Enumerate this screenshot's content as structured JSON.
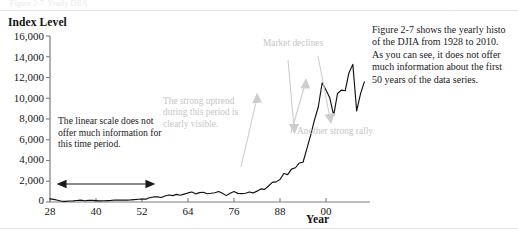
{
  "page": {
    "faint_top_text": "Figure 2-7. Yearly DJIA",
    "axis_value_title": "Index Level",
    "x_axis_title": "Year"
  },
  "annotations": {
    "linear_scale_note": "The linear scale does not offer much information for this time period.",
    "uptrend_note": "The strong uptrend during this period is clearly visible.",
    "declines_note": "Market declines",
    "rally_note": "Another strong rally"
  },
  "caption": {
    "lines": [
      "Figure 2-7 shows the yearly histo",
      "of the DJIA from 1928 to 2010.",
      "As you can see, it does not offer",
      "much information about the first",
      "50 years of the data series."
    ]
  },
  "colors": {
    "line": "#111111",
    "axis": "#7d7d7d",
    "annotation_gray": "#c6c6c6",
    "text": "#1a1a1a"
  },
  "chart_data": {
    "type": "line",
    "title": "",
    "xlabel": "Year",
    "ylabel": "Index Level",
    "ylim": [
      0,
      16000
    ],
    "xlim": [
      1928,
      2010
    ],
    "ytick_labels": [
      "0",
      "2,000",
      "4,000",
      "6,000",
      "8,000",
      "10,000",
      "12,000",
      "14,000",
      "16,000"
    ],
    "ytick_values": [
      0,
      2000,
      4000,
      6000,
      8000,
      10000,
      12000,
      14000,
      16000
    ],
    "xtick_labels": [
      "28",
      "40",
      "52",
      "64",
      "76",
      "88",
      "00"
    ],
    "xtick_values": [
      1928,
      1940,
      1952,
      1964,
      1976,
      1988,
      2000
    ],
    "grid": false,
    "legend": null,
    "series": [
      {
        "name": "DJIA yearly close",
        "x": [
          1928,
          1929,
          1930,
          1931,
          1932,
          1933,
          1934,
          1935,
          1936,
          1937,
          1938,
          1939,
          1940,
          1941,
          1942,
          1943,
          1944,
          1945,
          1946,
          1947,
          1948,
          1949,
          1950,
          1951,
          1952,
          1953,
          1954,
          1955,
          1956,
          1957,
          1958,
          1959,
          1960,
          1961,
          1962,
          1963,
          1964,
          1965,
          1966,
          1967,
          1968,
          1969,
          1970,
          1971,
          1972,
          1973,
          1974,
          1975,
          1976,
          1977,
          1978,
          1979,
          1980,
          1981,
          1982,
          1983,
          1984,
          1985,
          1986,
          1987,
          1988,
          1989,
          1990,
          1991,
          1992,
          1993,
          1994,
          1995,
          1996,
          1997,
          1998,
          1999,
          2000,
          2001,
          2002,
          2003,
          2004,
          2005,
          2006,
          2007,
          2008,
          2009,
          2010
        ],
        "y": [
          300,
          248,
          164,
          77,
          60,
          99,
          104,
          144,
          180,
          121,
          155,
          150,
          131,
          111,
          119,
          136,
          152,
          193,
          177,
          181,
          177,
          200,
          235,
          269,
          292,
          281,
          404,
          488,
          499,
          436,
          584,
          679,
          616,
          731,
          652,
          763,
          874,
          969,
          786,
          905,
          944,
          800,
          839,
          890,
          1020,
          851,
          616,
          852,
          1005,
          831,
          805,
          839,
          964,
          875,
          1047,
          1259,
          1212,
          1547,
          1896,
          1939,
          2169,
          2753,
          2634,
          3169,
          3301,
          3754,
          3834,
          5117,
          6448,
          7908,
          9181,
          11497,
          10787,
          10022,
          8342,
          10454,
          10783,
          10718,
          12463,
          13265,
          8776,
          10428,
          11578
        ]
      }
    ],
    "marked_regions": [
      {
        "label": "flat linear-scale period",
        "x_start": 1930,
        "x_end": 1954,
        "style": "double-headed-arrow"
      },
      {
        "label": "The strong uptrend during this period is clearly visible.",
        "x_start": 1980,
        "x_end": 1998,
        "direction": "up"
      },
      {
        "label": "Market declines",
        "x_start": 1999,
        "x_end": 2002,
        "direction": "down"
      },
      {
        "label": "Market declines",
        "x_start": 2007,
        "x_end": 2009,
        "direction": "down"
      },
      {
        "label": "Another strong rally",
        "x_start": 2002,
        "x_end": 2007,
        "direction": "up"
      }
    ]
  }
}
